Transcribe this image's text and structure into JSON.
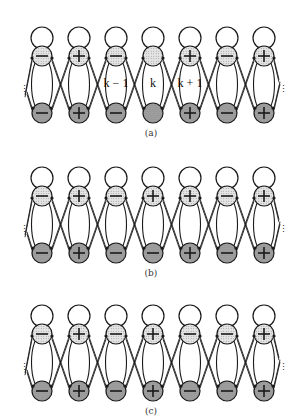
{
  "figure": {
    "cells_per_row": 7,
    "cell_spacing": 37,
    "first_cell_x": 42,
    "colors": {
      "stroke": "#1a1a1a",
      "top_fill": "#e4e4e4",
      "bottom_fill": "#a8a8a8",
      "empty_fill": "#ffffff"
    },
    "rows": [
      {
        "caption": "(a)",
        "y_offset": 0,
        "caption_y": 128,
        "top_signs": [
          "-",
          "+",
          "-",
          "",
          "+",
          "-",
          "+"
        ],
        "bottom_signs": [
          "-",
          "+",
          "-",
          "",
          "+",
          "-",
          "+"
        ],
        "cell_labels": [
          "",
          "",
          "k − 1",
          "k",
          "k + 1",
          "",
          ""
        ]
      },
      {
        "caption": "(b)",
        "y_offset": 140,
        "caption_y": 268,
        "top_signs": [
          "-",
          "+",
          "-",
          "+",
          "+",
          "-",
          "+"
        ],
        "bottom_signs": [
          "-",
          "+",
          "-",
          "-",
          "+",
          "-",
          "+"
        ],
        "cell_labels": [
          "",
          "",
          "",
          "",
          "",
          "",
          ""
        ]
      },
      {
        "caption": "(c)",
        "y_offset": 278,
        "caption_y": 406,
        "top_signs": [
          "-",
          "+",
          "-",
          "+",
          "-",
          "-",
          "+"
        ],
        "bottom_signs": [
          "-",
          "+",
          "-",
          "+",
          "-",
          "-",
          "+"
        ],
        "cell_labels": [
          "",
          "",
          "",
          "",
          "",
          "",
          ""
        ]
      }
    ],
    "continuation_marks": [
      "⋮",
      "⋮"
    ]
  }
}
